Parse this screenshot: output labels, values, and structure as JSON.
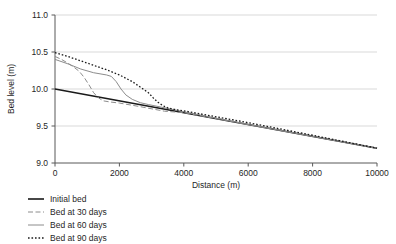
{
  "chart_data": {
    "type": "line",
    "title": "",
    "xlabel": "Distance (m)",
    "ylabel": "Bed level (m)",
    "xlim": [
      0,
      10000
    ],
    "ylim": [
      9.0,
      11.0
    ],
    "xticks": [
      0,
      2000,
      4000,
      6000,
      8000,
      10000
    ],
    "xtick_labels": [
      "0",
      "2000",
      "4000",
      "6000",
      "8000",
      "10000"
    ],
    "yticks": [
      9.0,
      9.5,
      10.0,
      10.5,
      11.0
    ],
    "ytick_labels": [
      "9.0",
      "9.5",
      "10.0",
      "10.5",
      "11.0"
    ],
    "grid": "horizontal",
    "legend_position": "below-left",
    "series": [
      {
        "name": "Initial bed",
        "style": "solid",
        "color": "#1a1a1a",
        "width": 1.6,
        "points": [
          [
            0,
            10.0
          ],
          [
            10000,
            9.2
          ]
        ]
      },
      {
        "name": "Bed at 30 days",
        "style": "dashed",
        "color": "#8c8c8c",
        "width": 1.0,
        "points": [
          [
            0,
            10.44
          ],
          [
            200,
            10.4
          ],
          [
            400,
            10.35
          ],
          [
            600,
            10.29
          ],
          [
            750,
            10.24
          ],
          [
            900,
            10.16
          ],
          [
            1050,
            10.06
          ],
          [
            1200,
            9.95
          ],
          [
            1350,
            9.88
          ],
          [
            1500,
            9.84
          ],
          [
            1700,
            9.825
          ],
          [
            2000,
            9.81
          ],
          [
            2600,
            9.765
          ],
          [
            3400,
            9.7
          ],
          [
            4000,
            9.68
          ],
          [
            6000,
            9.52
          ],
          [
            8000,
            9.36
          ],
          [
            10000,
            9.2
          ]
        ]
      },
      {
        "name": "Bed at 60 days",
        "style": "solid",
        "color": "#8c8c8c",
        "width": 1.0,
        "points": [
          [
            0,
            10.4
          ],
          [
            400,
            10.34
          ],
          [
            800,
            10.27
          ],
          [
            1200,
            10.22
          ],
          [
            1600,
            10.19
          ],
          [
            1750,
            10.17
          ],
          [
            1900,
            10.1
          ],
          [
            2050,
            10.0
          ],
          [
            2200,
            9.92
          ],
          [
            2400,
            9.86
          ],
          [
            2650,
            9.815
          ],
          [
            2900,
            9.79
          ],
          [
            3300,
            9.755
          ],
          [
            3700,
            9.72
          ],
          [
            4200,
            9.675
          ],
          [
            6000,
            9.52
          ],
          [
            8000,
            9.36
          ],
          [
            10000,
            9.2
          ]
        ]
      },
      {
        "name": "Bed at 90 days",
        "style": "dotted",
        "color": "#1a1a1a",
        "width": 1.3,
        "points": [
          [
            0,
            10.49
          ],
          [
            400,
            10.44
          ],
          [
            800,
            10.38
          ],
          [
            1200,
            10.32
          ],
          [
            1600,
            10.26
          ],
          [
            2000,
            10.19
          ],
          [
            2400,
            10.1
          ],
          [
            2700,
            10.01
          ],
          [
            2900,
            9.95
          ],
          [
            3050,
            9.88
          ],
          [
            3200,
            9.82
          ],
          [
            3350,
            9.775
          ],
          [
            3500,
            9.745
          ],
          [
            3700,
            9.725
          ],
          [
            4000,
            9.705
          ],
          [
            6000,
            9.545
          ],
          [
            8000,
            9.375
          ],
          [
            10000,
            9.2
          ]
        ]
      }
    ]
  },
  "legend": {
    "items": [
      {
        "label": "Initial bed"
      },
      {
        "label": "Bed at 30 days"
      },
      {
        "label": "Bed at 60 days"
      },
      {
        "label": "Bed at 90 days"
      }
    ]
  }
}
